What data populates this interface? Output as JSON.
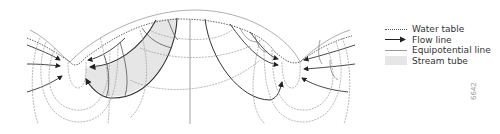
{
  "figure": {
    "legend": {
      "items": [
        {
          "label": "Water table",
          "style": "dotted-line"
        },
        {
          "label": "Flow line",
          "style": "arrow-line"
        },
        {
          "label": "Equipotential line",
          "style": "thin-line"
        },
        {
          "label": "Stream tube",
          "style": "shaded-area"
        }
      ]
    },
    "figure_id": "6642",
    "colors": {
      "line": "#444444",
      "equipotential": "#999999",
      "stream_tube": "#e6e6e6",
      "water_table": "#555555"
    }
  }
}
